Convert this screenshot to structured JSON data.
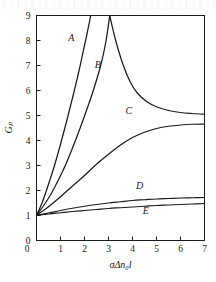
{
  "chart_data": {
    "type": "line",
    "title": "",
    "subtitle": "",
    "xlabel": "σΔn₀l",
    "ylabel": "Gₚ",
    "xlim": [
      0,
      7
    ],
    "ylim": [
      0,
      9
    ],
    "xticks": [
      "0",
      "1",
      "2",
      "3",
      "4",
      "5",
      "6",
      "7"
    ],
    "yticks": [
      "0",
      "1",
      "2",
      "3",
      "4",
      "5",
      "6",
      "7",
      "8",
      "9"
    ],
    "xtick_values": [
      0,
      1,
      2,
      3,
      4,
      5,
      6,
      7
    ],
    "ytick_values": [
      0,
      1,
      2,
      3,
      4,
      5,
      6,
      7,
      8,
      9
    ],
    "grid": false,
    "legend": "inline-curve-labels",
    "frame": "box",
    "line_color": "#1a1a1a",
    "background_color": "#ffffff",
    "series": [
      {
        "name": "A",
        "label": "A",
        "label_x": 1.45,
        "label_y": 8.0,
        "clipped_at_top": true,
        "x": [
          0.0,
          0.25,
          0.5,
          0.75,
          1.0,
          1.25,
          1.5,
          1.75,
          2.0,
          2.1,
          2.2,
          2.26
        ],
        "y": [
          1.0,
          1.55,
          2.25,
          3.0,
          3.85,
          4.75,
          5.7,
          6.7,
          7.8,
          8.25,
          8.72,
          9.0
        ]
      },
      {
        "name": "B",
        "label": "B",
        "label_x": 2.55,
        "label_y": 6.9,
        "clipped_at_top": true,
        "x": [
          0.0,
          0.3,
          0.6,
          0.9,
          1.2,
          1.5,
          1.8,
          2.1,
          2.4,
          2.7,
          2.9,
          3.05
        ],
        "y": [
          1.0,
          1.4,
          1.85,
          2.4,
          3.0,
          3.7,
          4.45,
          5.25,
          6.1,
          7.1,
          8.0,
          9.0
        ]
      },
      {
        "name": "B-upper",
        "label": "",
        "label_x": null,
        "label_y": null,
        "clipped_at_top": false,
        "x": [
          3.05,
          3.3,
          3.6,
          3.9,
          4.2,
          4.6,
          5.0,
          5.5,
          6.0,
          6.5,
          7.0
        ],
        "y": [
          9.0,
          8.0,
          7.05,
          6.35,
          5.9,
          5.55,
          5.35,
          5.2,
          5.12,
          5.08,
          5.05
        ]
      },
      {
        "name": "C",
        "label": "C",
        "label_x": 3.85,
        "label_y": 5.05,
        "clipped_at_top": false,
        "x": [
          0.0,
          0.5,
          1.0,
          1.5,
          2.0,
          2.5,
          3.0,
          3.5,
          4.0,
          4.5,
          5.0,
          5.5,
          6.0,
          6.5,
          7.0
        ],
        "y": [
          1.0,
          1.35,
          1.75,
          2.18,
          2.6,
          3.05,
          3.45,
          3.82,
          4.12,
          4.33,
          4.48,
          4.57,
          4.62,
          4.65,
          4.66
        ]
      },
      {
        "name": "D",
        "label": "D",
        "label_x": 4.3,
        "label_y": 2.05,
        "clipped_at_top": false,
        "x": [
          0.0,
          0.5,
          1.0,
          1.5,
          2.0,
          2.5,
          3.0,
          3.5,
          4.0,
          4.5,
          5.0,
          5.5,
          6.0,
          6.5,
          7.0
        ],
        "y": [
          1.0,
          1.1,
          1.2,
          1.29,
          1.37,
          1.44,
          1.5,
          1.55,
          1.6,
          1.63,
          1.66,
          1.68,
          1.7,
          1.71,
          1.72
        ]
      },
      {
        "name": "E",
        "label": "E",
        "label_x": 4.55,
        "label_y": 1.05,
        "clipped_at_top": false,
        "x": [
          0.0,
          0.5,
          1.0,
          1.5,
          2.0,
          2.5,
          3.0,
          3.5,
          4.0,
          4.5,
          5.0,
          5.5,
          6.0,
          6.5,
          7.0
        ],
        "y": [
          1.0,
          1.06,
          1.11,
          1.16,
          1.2,
          1.24,
          1.28,
          1.31,
          1.34,
          1.37,
          1.4,
          1.42,
          1.44,
          1.46,
          1.48
        ]
      }
    ]
  }
}
